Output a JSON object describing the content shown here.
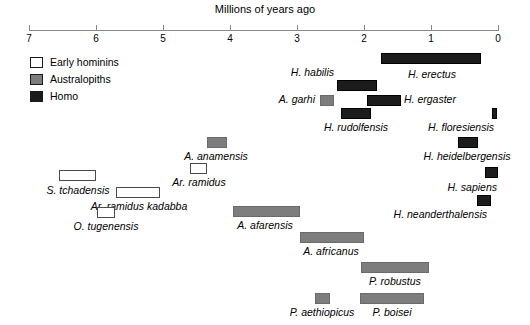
{
  "chart_data": {
    "type": "bar",
    "title": "Millions of years ago",
    "xlabel": "Millions of years ago",
    "ylabel": "",
    "orientation": "horizontal-ranges",
    "xlim": [
      7,
      0
    ],
    "x_axis_reversed": true,
    "grid": false,
    "ticks": [
      7,
      6,
      5,
      4,
      3,
      2,
      1,
      0
    ],
    "tick_labels": [
      "7",
      "6",
      "5",
      "4",
      "3",
      "2",
      "1",
      "0"
    ],
    "legend": {
      "position": "top-left",
      "entries": [
        {
          "label": "Early hominins",
          "color": "#ffffff",
          "group": "early"
        },
        {
          "label": "Australopiths",
          "color": "#7d7d7d",
          "group": "austral"
        },
        {
          "label": "Homo",
          "color": "#1b1b1b",
          "group": "homo"
        }
      ]
    },
    "series": [
      {
        "name": "H. habilis",
        "group": "homo",
        "start_mya": 2.4,
        "end_mya": 1.8,
        "label_pos": "left-above"
      },
      {
        "name": "H. erectus",
        "group": "homo",
        "start_mya": 1.75,
        "end_mya": 0.25,
        "label_pos": "center-below"
      },
      {
        "name": "A. garhi",
        "group": "austral",
        "start_mya": 2.65,
        "end_mya": 2.45,
        "label_pos": "left-inline"
      },
      {
        "name": "H. ergaster",
        "group": "homo",
        "start_mya": 1.95,
        "end_mya": 1.45,
        "label_pos": "right-inline"
      },
      {
        "name": "H. rudolfensis",
        "group": "homo",
        "start_mya": 2.35,
        "end_mya": 1.9,
        "label_pos": "center-below"
      },
      {
        "name": "H. floresiensis",
        "group": "homo",
        "start_mya": 0.09,
        "end_mya": 0.02,
        "label_pos": "left-below"
      },
      {
        "name": "H. heidelbergensis",
        "group": "homo",
        "start_mya": 0.6,
        "end_mya": 0.3,
        "label_pos": "center-below"
      },
      {
        "name": "H. sapiens",
        "group": "homo",
        "start_mya": 0.2,
        "end_mya": 0.0,
        "label_pos": "left-below"
      },
      {
        "name": "H. neanderthalensis",
        "group": "homo",
        "start_mya": 0.31,
        "end_mya": 0.1,
        "label_pos": "left-below"
      },
      {
        "name": "A. anamensis",
        "group": "austral",
        "start_mya": 4.35,
        "end_mya": 4.05,
        "label_pos": "center-below"
      },
      {
        "name": "Ar. ramidus",
        "group": "early",
        "start_mya": 4.6,
        "end_mya": 4.35,
        "label_pos": "center-below"
      },
      {
        "name": "S. tchadensis",
        "group": "early",
        "start_mya": 6.55,
        "end_mya": 6.0,
        "label_pos": "center-below"
      },
      {
        "name": "Ar. ramidus kadabba",
        "group": "early",
        "start_mya": 5.7,
        "end_mya": 5.05,
        "label_pos": "center-below"
      },
      {
        "name": "O. tugenensis",
        "group": "early",
        "start_mya": 5.98,
        "end_mya": 5.72,
        "label_pos": "center-below"
      },
      {
        "name": "A. afarensis",
        "group": "austral",
        "start_mya": 3.95,
        "end_mya": 2.95,
        "label_pos": "center-below"
      },
      {
        "name": "A. africanus",
        "group": "austral",
        "start_mya": 2.95,
        "end_mya": 2.0,
        "label_pos": "center-below"
      },
      {
        "name": "P. robustus",
        "group": "austral",
        "start_mya": 2.05,
        "end_mya": 1.03,
        "label_pos": "center-below"
      },
      {
        "name": "P. aethiopicus",
        "group": "austral",
        "start_mya": 2.73,
        "end_mya": 2.5,
        "label_pos": "center-below"
      },
      {
        "name": "P. boisei",
        "group": "austral",
        "start_mya": 2.06,
        "end_mya": 1.1,
        "label_pos": "center-below"
      }
    ]
  },
  "axis": {
    "title": "Millions of years ago",
    "tick_labels": [
      "7",
      "6",
      "5",
      "4",
      "3",
      "2",
      "1",
      "0"
    ]
  },
  "legend": {
    "items": [
      {
        "label": "Early hominins"
      },
      {
        "label": "Australopiths"
      },
      {
        "label": "Homo"
      }
    ]
  },
  "taxa": [
    {
      "name": "H. habilis"
    },
    {
      "name": "H. erectus"
    },
    {
      "name": "A. garhi"
    },
    {
      "name": "H. ergaster"
    },
    {
      "name": "H. rudolfensis"
    },
    {
      "name": "H. floresiensis"
    },
    {
      "name": "H. heidelbergensis"
    },
    {
      "name": "H. sapiens"
    },
    {
      "name": "H. neanderthalensis"
    },
    {
      "name": "A. anamensis"
    },
    {
      "name": "Ar. ramidus"
    },
    {
      "name": "S. tchadensis"
    },
    {
      "name": "Ar. ramidus kadabba"
    },
    {
      "name": "O. tugenensis"
    },
    {
      "name": "A. afarensis"
    },
    {
      "name": "A. africanus"
    },
    {
      "name": "P. robustus"
    },
    {
      "name": "P. aethiopicus"
    },
    {
      "name": "P. boisei"
    }
  ]
}
